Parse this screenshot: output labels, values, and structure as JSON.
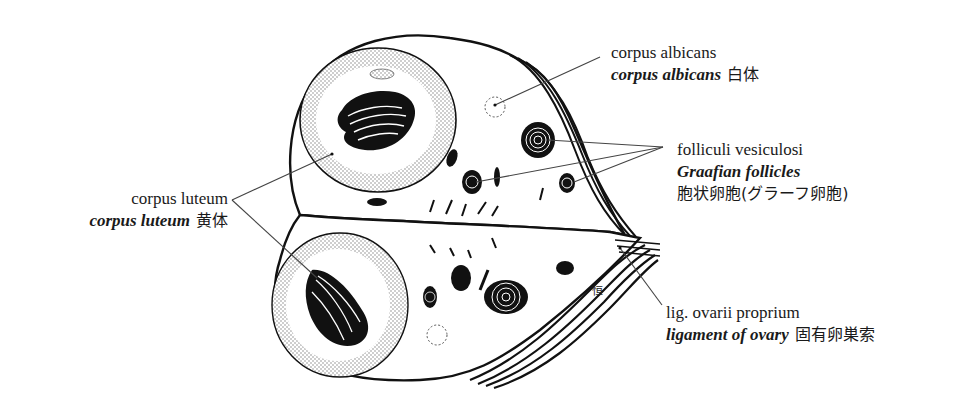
{
  "figure": {
    "subject": "ovary",
    "signature": "恒",
    "colors": {
      "ink": "#111111",
      "leader": "#444444",
      "background": "#ffffff",
      "stipple": "#8a8a8a"
    }
  },
  "labels": {
    "corpus_albicans": {
      "latin": "corpus albicans",
      "english": "corpus albicans",
      "japanese": "白体"
    },
    "folliculi_vesiculosi": {
      "latin": "folliculi vesiculosi",
      "english": "Graafian follicles",
      "japanese": "胞状卵胞(グラーフ卵胞)"
    },
    "corpus_luteum": {
      "latin": "corpus luteum",
      "english": "corpus luteum",
      "japanese": "黄体"
    },
    "lig_ovarii_proprium": {
      "latin": "lig. ovarii proprium",
      "english": "ligament of ovary",
      "japanese": "固有卵巣索"
    }
  }
}
